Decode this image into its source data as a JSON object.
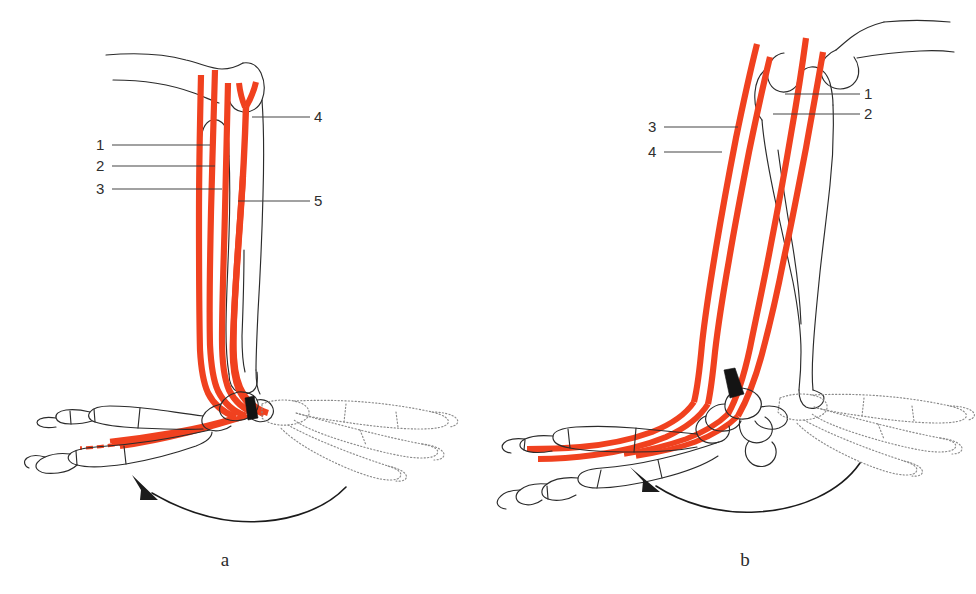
{
  "figure": {
    "kind": "anatomical-line-diagram",
    "background_color": "#ffffff",
    "tendon_color": "#f0411f",
    "bone_outline_color": "#2b2b2b",
    "ghost_outline_color": "#8b8b8b",
    "marker_color": "#141414",
    "leader_line_color": "#3a3a3a"
  },
  "panels": [
    {
      "id": "a",
      "caption": "a",
      "caption_x": 225,
      "caption_y": 566,
      "labels": [
        {
          "text": "1",
          "x": 96,
          "y": 150,
          "side": "left",
          "leader": "M 112 145 L 210 145"
        },
        {
          "text": "2",
          "x": 96,
          "y": 171,
          "side": "left",
          "leader": "M 112 166 L 215 166"
        },
        {
          "text": "3",
          "x": 96,
          "y": 194,
          "side": "left",
          "leader": "M 112 189 L 222 189"
        },
        {
          "text": "4",
          "x": 314,
          "y": 122,
          "side": "right",
          "leader": "M 310 117 L 252 117"
        },
        {
          "text": "5",
          "x": 314,
          "y": 206,
          "side": "right",
          "leader": "M 310 201 L 238 201"
        }
      ]
    },
    {
      "id": "b",
      "caption": "b",
      "caption_x": 745,
      "caption_y": 566,
      "labels": [
        {
          "text": "1",
          "x": 864,
          "y": 99,
          "side": "right",
          "leader": "M 860 94 L 785 94"
        },
        {
          "text": "2",
          "x": 864,
          "y": 119,
          "side": "right",
          "leader": "M 860 114 L 773 114"
        },
        {
          "text": "3",
          "x": 648,
          "y": 132,
          "side": "left",
          "leader": "M 664 127 L 738 127"
        },
        {
          "text": "4",
          "x": 648,
          "y": 157,
          "side": "left",
          "leader": "M 664 152 L 722 152"
        }
      ]
    }
  ],
  "motion_arrows": [
    {
      "panel": "a",
      "description": "curved arrow showing foot rotating from dorsiflexed ghost position to plantarflexed solid position"
    },
    {
      "panel": "b",
      "description": "curved arrow showing foot rotating from ghost position to solid position"
    }
  ]
}
